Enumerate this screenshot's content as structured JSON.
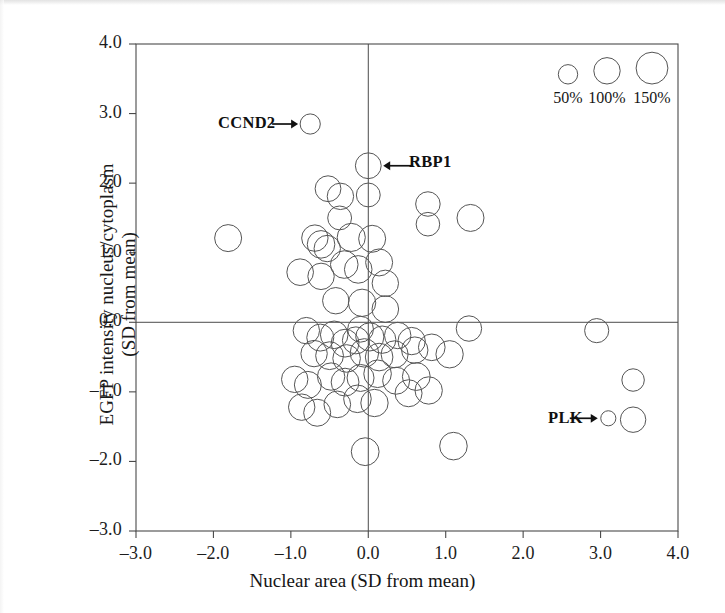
{
  "figure": {
    "type": "bubble-scatter",
    "background": "#ffffff",
    "stroke_color": "#555555",
    "axis_color": "#4a4a4a"
  },
  "chart_data": {
    "type": "scatter",
    "title": "",
    "subtitle": "",
    "xlabel": "Nuclear area (SD from mean)",
    "ylabel": "EGFP intensity nucleus/cytoplasm (SD from mean)",
    "ylabel_lines": [
      "EGFP intensity nucleus/cytoplasm",
      "(SD from mean)"
    ],
    "xlim": [
      -3.0,
      4.0
    ],
    "ylim": [
      -3.0,
      4.0
    ],
    "xticks": [
      -3.0,
      -2.0,
      -1.0,
      0.0,
      1.0,
      2.0,
      3.0,
      4.0
    ],
    "yticks": [
      -3.0,
      -2.0,
      -1.0,
      0.0,
      1.0,
      2.0,
      3.0,
      4.0
    ],
    "xtick_labels": [
      "–3.0",
      "–2.0",
      "–1.0",
      "0.0",
      "1.0",
      "2.0",
      "3.0",
      "4.0"
    ],
    "ytick_labels": [
      "–3.0",
      "–2.0",
      "–1.0",
      "0.0",
      "1.0",
      "2.0",
      "3.0",
      "4.0"
    ],
    "grid": false,
    "zero_lines": {
      "x": 0.0,
      "y": 0.0
    },
    "marker_style": "open-circle",
    "size_encoding": {
      "meaning": "cell number relative to control (%)",
      "legend_values": [
        50,
        100,
        150
      ],
      "legend_labels": [
        "50%",
        "100%",
        "150%"
      ]
    },
    "annotations": [
      {
        "label": "CCND2",
        "x": -0.75,
        "y": 2.85,
        "arrow": "right"
      },
      {
        "label": "RBP1",
        "x": 0.0,
        "y": 2.25,
        "arrow": "left"
      },
      {
        "label": "PLK",
        "x": 3.1,
        "y": -1.38,
        "arrow": "right"
      }
    ],
    "points": [
      {
        "x": -0.75,
        "y": 2.85,
        "size": 55,
        "label": "CCND2"
      },
      {
        "x": 0.0,
        "y": 2.25,
        "size": 95,
        "label": "RBP1"
      },
      {
        "x": 0.0,
        "y": 1.83,
        "size": 80,
        "label": ""
      },
      {
        "x": -1.81,
        "y": 1.21,
        "size": 105,
        "label": ""
      },
      {
        "x": -0.52,
        "y": 1.92,
        "size": 95,
        "label": ""
      },
      {
        "x": -0.36,
        "y": 1.81,
        "size": 100,
        "label": ""
      },
      {
        "x": -0.37,
        "y": 1.5,
        "size": 80,
        "label": ""
      },
      {
        "x": 0.77,
        "y": 1.7,
        "size": 85,
        "label": ""
      },
      {
        "x": 0.77,
        "y": 1.41,
        "size": 78,
        "label": ""
      },
      {
        "x": 1.32,
        "y": 1.5,
        "size": 105,
        "label": ""
      },
      {
        "x": -0.69,
        "y": 1.21,
        "size": 100,
        "label": ""
      },
      {
        "x": -0.61,
        "y": 1.12,
        "size": 110,
        "label": ""
      },
      {
        "x": -0.53,
        "y": 1.06,
        "size": 100,
        "label": ""
      },
      {
        "x": -0.22,
        "y": 1.22,
        "size": 115,
        "label": ""
      },
      {
        "x": 0.05,
        "y": 1.2,
        "size": 105,
        "label": ""
      },
      {
        "x": -0.88,
        "y": 0.72,
        "size": 102,
        "label": ""
      },
      {
        "x": -0.61,
        "y": 0.66,
        "size": 100,
        "label": ""
      },
      {
        "x": -0.31,
        "y": 0.83,
        "size": 110,
        "label": ""
      },
      {
        "x": -0.13,
        "y": 0.76,
        "size": 110,
        "label": ""
      },
      {
        "x": 0.14,
        "y": 0.86,
        "size": 105,
        "label": ""
      },
      {
        "x": 0.22,
        "y": 0.56,
        "size": 100,
        "label": ""
      },
      {
        "x": -0.42,
        "y": 0.31,
        "size": 100,
        "label": ""
      },
      {
        "x": -0.08,
        "y": 0.28,
        "size": 108,
        "label": ""
      },
      {
        "x": 0.22,
        "y": 0.19,
        "size": 102,
        "label": ""
      },
      {
        "x": -0.1,
        "y": -0.1,
        "size": 95,
        "label": ""
      },
      {
        "x": 1.3,
        "y": -0.09,
        "size": 92,
        "label": ""
      },
      {
        "x": -0.8,
        "y": -0.12,
        "size": 100,
        "label": ""
      },
      {
        "x": -0.62,
        "y": -0.22,
        "size": 105,
        "label": ""
      },
      {
        "x": -0.44,
        "y": -0.18,
        "size": 110,
        "label": ""
      },
      {
        "x": -0.3,
        "y": -0.3,
        "size": 112,
        "label": ""
      },
      {
        "x": -0.16,
        "y": -0.26,
        "size": 105,
        "label": ""
      },
      {
        "x": 0.02,
        "y": -0.21,
        "size": 115,
        "label": ""
      },
      {
        "x": 0.18,
        "y": -0.25,
        "size": 108,
        "label": ""
      },
      {
        "x": 0.38,
        "y": -0.19,
        "size": 100,
        "label": ""
      },
      {
        "x": 0.56,
        "y": -0.27,
        "size": 108,
        "label": ""
      },
      {
        "x": -0.7,
        "y": -0.45,
        "size": 100,
        "label": ""
      },
      {
        "x": -0.5,
        "y": -0.48,
        "size": 112,
        "label": ""
      },
      {
        "x": -0.28,
        "y": -0.52,
        "size": 110,
        "label": ""
      },
      {
        "x": -0.05,
        "y": -0.44,
        "size": 118,
        "label": ""
      },
      {
        "x": 0.14,
        "y": -0.5,
        "size": 110,
        "label": ""
      },
      {
        "x": 0.34,
        "y": -0.46,
        "size": 105,
        "label": ""
      },
      {
        "x": 0.6,
        "y": -0.4,
        "size": 100,
        "label": ""
      },
      {
        "x": 0.82,
        "y": -0.36,
        "size": 102,
        "label": ""
      },
      {
        "x": 1.05,
        "y": -0.46,
        "size": 108,
        "label": ""
      },
      {
        "x": -0.95,
        "y": -0.82,
        "size": 100,
        "label": ""
      },
      {
        "x": -0.78,
        "y": -0.9,
        "size": 105,
        "label": ""
      },
      {
        "x": -0.48,
        "y": -0.78,
        "size": 108,
        "label": ""
      },
      {
        "x": -0.3,
        "y": -0.86,
        "size": 112,
        "label": ""
      },
      {
        "x": -0.1,
        "y": -0.8,
        "size": 105,
        "label": ""
      },
      {
        "x": 0.12,
        "y": -0.74,
        "size": 110,
        "label": ""
      },
      {
        "x": 0.36,
        "y": -0.84,
        "size": 105,
        "label": ""
      },
      {
        "x": 0.62,
        "y": -0.78,
        "size": 112,
        "label": ""
      },
      {
        "x": -0.86,
        "y": -1.22,
        "size": 100,
        "label": ""
      },
      {
        "x": -0.66,
        "y": -1.3,
        "size": 105,
        "label": ""
      },
      {
        "x": -0.4,
        "y": -1.18,
        "size": 102,
        "label": ""
      },
      {
        "x": -0.14,
        "y": -1.1,
        "size": 110,
        "label": ""
      },
      {
        "x": 0.08,
        "y": -1.16,
        "size": 108,
        "label": ""
      },
      {
        "x": 0.52,
        "y": -1.02,
        "size": 105,
        "label": ""
      },
      {
        "x": 0.78,
        "y": -0.98,
        "size": 108,
        "label": ""
      },
      {
        "x": -0.04,
        "y": -1.86,
        "size": 112,
        "label": ""
      },
      {
        "x": 1.1,
        "y": -1.78,
        "size": 110,
        "label": ""
      },
      {
        "x": 2.95,
        "y": -0.12,
        "size": 82,
        "label": ""
      },
      {
        "x": 3.42,
        "y": -0.83,
        "size": 70,
        "label": ""
      },
      {
        "x": 3.1,
        "y": -1.38,
        "size": 28,
        "label": "PLK"
      },
      {
        "x": 3.42,
        "y": -1.4,
        "size": 92,
        "label": ""
      }
    ]
  },
  "axes": {
    "x_title": "Nuclear area (SD from mean)",
    "y_title_line1": "EGFP intensity nucleus/cytoplasm",
    "y_title_line2": "(SD from mean)"
  },
  "legend": {
    "items": [
      {
        "label": "50%",
        "value": 50
      },
      {
        "label": "100%",
        "value": 100
      },
      {
        "label": "150%",
        "value": 150
      }
    ]
  },
  "annotations": {
    "ccnd2": "CCND2",
    "rbp1": "RBP1",
    "plk": "PLK"
  }
}
